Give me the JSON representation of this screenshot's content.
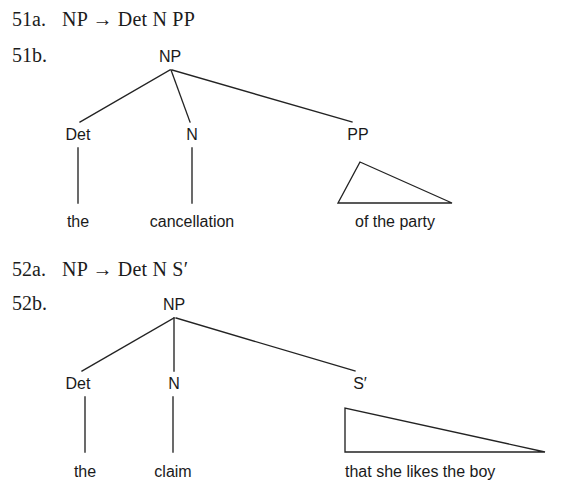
{
  "page": {
    "background": "#ffffff",
    "ink": "#1a1a1a",
    "stroke": "#232323"
  },
  "examples": [
    {
      "rule_label": "51a.",
      "rule_text": "NP → Det N PP",
      "tree_label": "51b.",
      "tree": {
        "root": "NP",
        "children": [
          "Det",
          "N",
          "PP"
        ],
        "terminals": [
          "the",
          "cancellation",
          "of the party"
        ],
        "triangle_node": "PP",
        "triangle_terminal": "of the party",
        "triangle_shape": "scalene"
      }
    },
    {
      "rule_label": "52a.",
      "rule_text": "NP → Det N S′",
      "tree_label": "52b.",
      "tree": {
        "root": "NP",
        "children": [
          "Det",
          "N",
          "S′"
        ],
        "terminals": [
          "the",
          "claim",
          "that she likes the boy"
        ],
        "triangle_node": "S′",
        "triangle_terminal": "that she likes the boy",
        "triangle_shape": "right"
      }
    }
  ]
}
